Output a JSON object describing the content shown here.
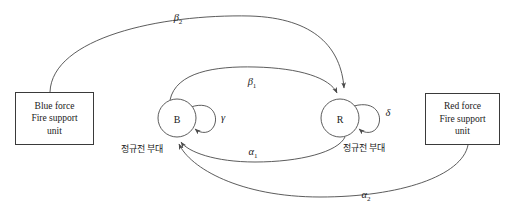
{
  "diagram": {
    "type": "state-transition-diagram",
    "stroke_color": "#4a4a4a",
    "text_color": "#1a1a1a",
    "background": "#ffffff",
    "nodes": [
      {
        "id": "B",
        "label": "B",
        "name": "blue-regular-force-node",
        "cx": 177,
        "cy": 118,
        "r": 19,
        "caption": "정규전 부대"
      },
      {
        "id": "R",
        "label": "R",
        "name": "red-regular-force-node",
        "cx": 340,
        "cy": 118,
        "r": 19,
        "caption": "정규전 부대"
      }
    ],
    "boxes": [
      {
        "id": "blue-force-box",
        "lines": [
          "Blue force",
          "Fire support",
          "unit"
        ]
      },
      {
        "id": "red-force-box",
        "lines": [
          "Red force",
          "Fire support",
          "unit"
        ]
      }
    ],
    "edges": [
      {
        "id": "beta2",
        "symbol": "β",
        "sub": "2",
        "from": "blue-force-box",
        "to": "R",
        "label_x": 178,
        "label_y": 19
      },
      {
        "id": "beta1",
        "symbol": "β",
        "sub": "1",
        "from": "B",
        "to": "R",
        "label_x": 252,
        "label_y": 83
      },
      {
        "id": "gamma",
        "symbol": "γ",
        "sub": "",
        "from": "B",
        "to": "B",
        "label_x": 223,
        "label_y": 119
      },
      {
        "id": "delta",
        "symbol": "δ",
        "sub": "",
        "from": "R",
        "to": "R",
        "label_x": 388,
        "label_y": 114
      },
      {
        "id": "alpha1",
        "symbol": "α",
        "sub": "1",
        "from": "R",
        "to": "B",
        "label_x": 253,
        "label_y": 153
      },
      {
        "id": "alpha2",
        "symbol": "α",
        "sub": "2",
        "from": "red-force-box",
        "to": "B",
        "label_x": 366,
        "label_y": 196
      }
    ]
  }
}
